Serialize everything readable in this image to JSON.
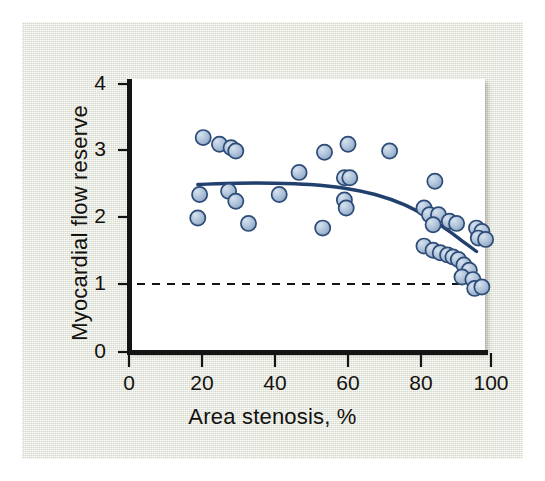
{
  "figure": {
    "background_color": "#e4e8da",
    "plot_background_color": "#ffffff",
    "axis_color": "#141414",
    "marker_fill_color": "#a8bdd6",
    "marker_edge_color": "#2d4b77",
    "curve_color": "#21406e",
    "reference_line_color": "#141414"
  },
  "axis_labels": {
    "x": "Area stenosis, %",
    "y": "Myocardial flow reserve"
  },
  "ticks": {
    "x": [
      "0",
      "20",
      "40",
      "60",
      "80",
      "100"
    ],
    "y": [
      "0",
      "1",
      "2",
      "3",
      "4"
    ]
  },
  "chart_data": {
    "type": "scatter",
    "title": "",
    "xlabel": "Area stenosis, %",
    "ylabel": "Myocardial flow reserve",
    "xlim": [
      0,
      100
    ],
    "ylim": [
      0,
      4
    ],
    "xticks": [
      0,
      20,
      40,
      60,
      80,
      100
    ],
    "yticks": [
      0,
      1,
      2,
      3,
      4
    ],
    "grid": false,
    "legend": false,
    "series": [
      {
        "name": "Myocardial flow reserve vs area stenosis",
        "marker": "circle",
        "points": [
          [
            20.5,
            3.2
          ],
          [
            25.0,
            3.1
          ],
          [
            28.2,
            3.05
          ],
          [
            29.5,
            3.0
          ],
          [
            19.5,
            2.35
          ],
          [
            27.5,
            2.4
          ],
          [
            29.5,
            2.25
          ],
          [
            19.0,
            2.0
          ],
          [
            33.0,
            1.92
          ],
          [
            41.5,
            2.35
          ],
          [
            47.0,
            2.68
          ],
          [
            54.0,
            2.98
          ],
          [
            53.5,
            1.85
          ],
          [
            59.5,
            2.6
          ],
          [
            61.0,
            2.6
          ],
          [
            59.5,
            2.27
          ],
          [
            60.0,
            2.15
          ],
          [
            60.5,
            3.1
          ],
          [
            72.0,
            3.0
          ],
          [
            84.5,
            2.55
          ],
          [
            81.5,
            2.15
          ],
          [
            83.0,
            2.05
          ],
          [
            85.5,
            2.05
          ],
          [
            84.0,
            1.9
          ],
          [
            88.5,
            1.95
          ],
          [
            90.5,
            1.92
          ],
          [
            96.0,
            1.85
          ],
          [
            97.5,
            1.8
          ],
          [
            96.5,
            1.7
          ],
          [
            98.5,
            1.68
          ],
          [
            81.5,
            1.58
          ],
          [
            84.0,
            1.52
          ],
          [
            86.0,
            1.48
          ],
          [
            88.0,
            1.45
          ],
          [
            89.5,
            1.42
          ],
          [
            91.0,
            1.38
          ],
          [
            92.5,
            1.3
          ],
          [
            94.0,
            1.22
          ],
          [
            92.0,
            1.12
          ],
          [
            95.0,
            1.08
          ],
          [
            95.5,
            0.95
          ],
          [
            97.5,
            0.97
          ]
        ]
      }
    ],
    "fit_curve": {
      "name": "quadratic fit",
      "points": [
        [
          19.0,
          2.5
        ],
        [
          30.0,
          2.52
        ],
        [
          40.0,
          2.52
        ],
        [
          50.0,
          2.5
        ],
        [
          60.0,
          2.44
        ],
        [
          68.0,
          2.35
        ],
        [
          76.0,
          2.2
        ],
        [
          83.0,
          2.0
        ],
        [
          88.0,
          1.82
        ],
        [
          92.0,
          1.66
        ],
        [
          96.0,
          1.5
        ]
      ]
    },
    "reference_line": {
      "orientation": "horizontal",
      "value": 1.0,
      "style": "dashed"
    }
  }
}
